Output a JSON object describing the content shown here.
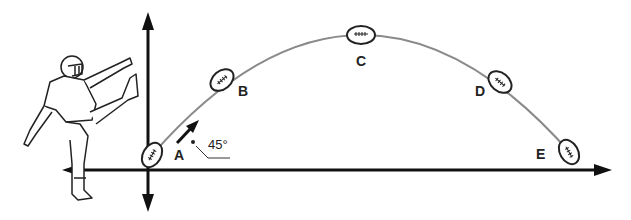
{
  "diagram": {
    "colors": {
      "axis": "#111111",
      "trajectory": "#888888",
      "ball": "#222222",
      "label": "#222222"
    },
    "points": [
      {
        "id": "A",
        "label": "A",
        "x": 152,
        "y": 155
      },
      {
        "id": "B",
        "label": "B",
        "x": 220,
        "y": 82
      },
      {
        "id": "C",
        "label": "C",
        "x": 362,
        "y": 35
      },
      {
        "id": "D",
        "label": "D",
        "x": 500,
        "y": 82
      },
      {
        "id": "E",
        "label": "E",
        "x": 572,
        "y": 153
      }
    ],
    "angle_label": "45°",
    "axes": {
      "horizontal": "ground line with arrows both directions",
      "vertical": "vertical axis with arrows up and down"
    },
    "figure": "football kicker"
  }
}
